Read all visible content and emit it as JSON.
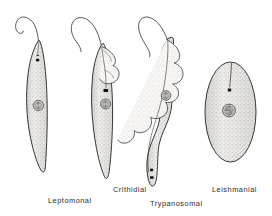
{
  "figure": {
    "background_color": "#ffffff",
    "ink_color": "#2b2b2b",
    "fill_color": "#f2f1ee",
    "stipple_color": "#8d8b86",
    "style": "stippled pen-and-ink line drawing",
    "organism_count": 4
  },
  "specimens": [
    {
      "id": "leptomonal",
      "label": "Leptomonal",
      "label_x": 48,
      "label_y": 203,
      "shape": "elongate spindle / fusiform",
      "flagellum": "long free anterior flagellum, hooked at distal end",
      "undulating_membrane": "absent",
      "kinetoplast": "small dark dot anterior to nucleus",
      "nucleus": "stippled round body near mid-cell",
      "body_top": 38,
      "body_bottom": 172
    },
    {
      "id": "crithidial",
      "label": "Crithidial",
      "label_x": 113,
      "label_y": 192,
      "shape": "elongate, broader anteriorly",
      "flagellum": "free anterior flagellum with recurved loop",
      "undulating_membrane": "short, confined to anterior third",
      "kinetoplast": "dark bar just anterior to nucleus",
      "nucleus": "stippled round body, anterior third",
      "body_top": 40,
      "body_bottom": 178
    },
    {
      "id": "trypanosomal",
      "label": "Trypanosomal",
      "label_x": 150,
      "label_y": 206,
      "shape": "sinuous S-curved body",
      "flagellum": "free anterior flagellum continuing from membrane",
      "undulating_membrane": "full-length, strongly folded along one side",
      "kinetoplast": "two dark dots at posterior end",
      "nucleus": "stippled round body above mid-cell",
      "body_top": 36,
      "body_bottom": 186
    },
    {
      "id": "leishmanial",
      "label": "Leishmanial",
      "label_x": 212,
      "label_y": 192,
      "shape": "oval / rounded amastigote",
      "flagellum": "rudimentary, internal only (no free flagellum)",
      "undulating_membrane": "absent",
      "kinetoplast": "small dark square below the axoneme line",
      "nucleus": "large stippled nucleus at centre",
      "body_top": 62,
      "body_bottom": 162
    }
  ]
}
